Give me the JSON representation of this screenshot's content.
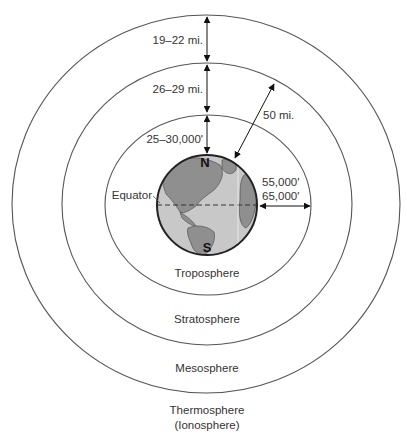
{
  "diagram": {
    "layers": [
      {
        "name": "Troposphere"
      },
      {
        "name": "Stratosphere"
      },
      {
        "name": "Mesosphere"
      },
      {
        "name": "Thermosphere",
        "subname": "(Ionosphere)"
      }
    ],
    "measurements": {
      "mesosphere_thickness": "19–22 mi.",
      "stratosphere_thickness": "26–29 mi.",
      "troposphere_polar": "25–30,000'",
      "total_to_stratopause": "50 mi.",
      "equatorial_1": "55,000'",
      "equatorial_2": "65,000'"
    },
    "globe": {
      "north_label": "N",
      "south_label": "S",
      "equator_label": "Equator"
    },
    "colors": {
      "ring_stroke": "#555555",
      "globe_ocean": "#c8c8c8",
      "globe_land": "#8f8f8f",
      "globe_outline": "#222222"
    }
  }
}
